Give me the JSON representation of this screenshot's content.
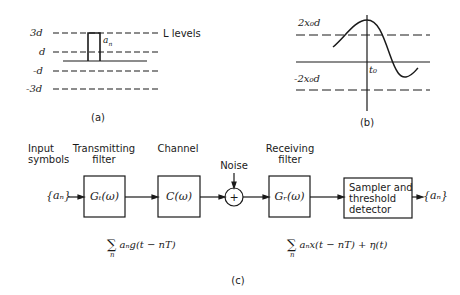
{
  "panel_a": {
    "level_labels": [
      "3d",
      "d",
      "-d",
      "-3d"
    ],
    "pulse_label": "a",
    "pulse_label_sub": "n",
    "levels_annotation": "L  levels",
    "caption": "(a)"
  },
  "panel_b": {
    "upper_label": "2x₀d",
    "lower_label": "-2x₀d",
    "axis_label": "t₀",
    "caption": "(b)"
  },
  "panel_c": {
    "labels": {
      "input_line1": "Input",
      "input_line2": "symbols",
      "tx_line1": "Transmitting",
      "tx_line2": "filter",
      "channel": "Channel",
      "noise": "Noise",
      "rx_line1": "Receiving",
      "rx_line2": "filter"
    },
    "input_symbol": "{aₙ}",
    "output_symbol": "{aₙ}",
    "blocks": {
      "tx": "Gₜ(ω)",
      "channel": "C(ω)",
      "summer": "+",
      "rx": "Gᵣ(ω)",
      "sampler_line1": "Sampler and",
      "sampler_line2": "threshold",
      "sampler_line3": "detector"
    },
    "formula_tx": "aₙg(t − nT)",
    "formula_rx": "aₙx(t − nT) + η(t)",
    "sum_symbol": "∑",
    "sum_index": "n",
    "caption": "(c)"
  }
}
